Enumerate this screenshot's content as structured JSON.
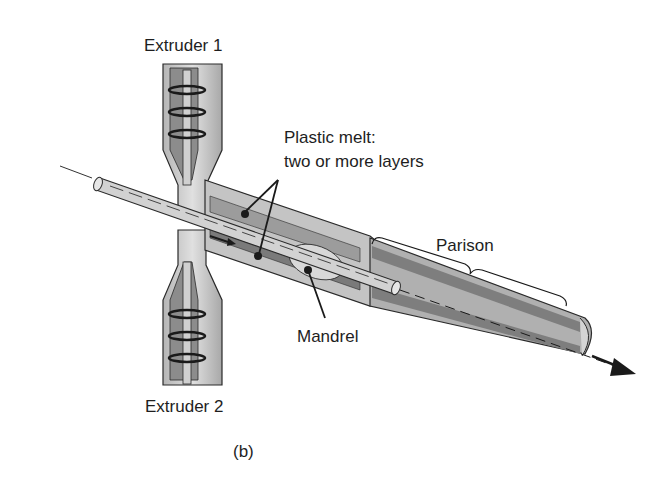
{
  "figure": {
    "caption": "(b)",
    "labels": {
      "extruder_1": "Extruder 1",
      "extruder_2": "Extruder 2",
      "plastic_melt_line1": "Plastic melt:",
      "plastic_melt_line2": "two or more layers",
      "parison": "Parison",
      "mandrel": "Mandrel"
    },
    "colors": {
      "dark_gray": "#6e6e6e",
      "mid_gray": "#9a9a9a",
      "light_gray": "#c8c8c8",
      "pale_gray": "#dedede",
      "outline": "#2a2a2a"
    }
  }
}
